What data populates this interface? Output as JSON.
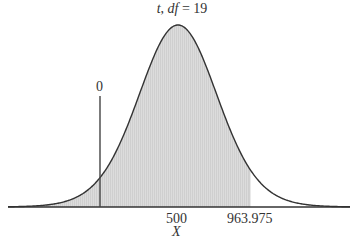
{
  "chart_data": {
    "type": "area",
    "title_var": "t",
    "title_df_label": "df",
    "title_df_value": "19",
    "title": "t, df = 19",
    "distribution": "Student t",
    "df": 19,
    "xlabel": "X",
    "ylabel": "",
    "center": 500,
    "x_ticks": [
      {
        "value": 500,
        "label": "500"
      },
      {
        "value": 963.975,
        "label": "963.975"
      }
    ],
    "reference_line": {
      "value": 0,
      "label": "0"
    },
    "shaded_region": {
      "from": "-inf",
      "to": 963.975
    },
    "grid": false,
    "legend": null
  },
  "labels": {
    "title_prefix": "t, ",
    "title_df": "df",
    "title_suffix": " = 19",
    "tick_center": "500",
    "tick_cutoff": "963.975",
    "reference": "0",
    "xlabel": "X"
  },
  "colors": {
    "curve": "#333333",
    "shade": "#d9d9d9",
    "axis": "#333333"
  }
}
